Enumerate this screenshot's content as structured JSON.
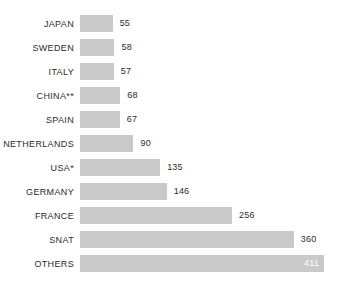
{
  "chart_data": {
    "type": "bar",
    "orientation": "horizontal",
    "title": "",
    "subtitle": "",
    "xlabel": "",
    "ylabel": "",
    "grid": false,
    "legend": false,
    "axis_visible": false,
    "xlim": [
      0,
      411
    ],
    "categories": [
      "JAPAN",
      "SWEDEN",
      "ITALY",
      "CHINA**",
      "SPAIN",
      "NETHERLANDS",
      "USA*",
      "GERMANY",
      "FRANCE",
      "SNAT",
      "OTHERS"
    ],
    "values": [
      55,
      58,
      57,
      68,
      67,
      90,
      135,
      146,
      256,
      360,
      411
    ],
    "value_labels": [
      "55",
      "58",
      "57",
      "68",
      "67",
      "90",
      "135",
      "146",
      "256",
      "360",
      "411"
    ],
    "label_placement": [
      "outside",
      "outside",
      "outside",
      "outside",
      "outside",
      "outside",
      "outside",
      "outside",
      "outside",
      "outside",
      "inside"
    ],
    "bar_color": "#c9c9c9",
    "label_color": "#2b2b2b",
    "inside_label_color": "#ffffff",
    "background_color": "#ffffff",
    "bars": [
      {
        "category": "JAPAN",
        "value": 55,
        "label": "55",
        "placement": "outside"
      },
      {
        "category": "SWEDEN",
        "value": 58,
        "label": "58",
        "placement": "outside"
      },
      {
        "category": "ITALY",
        "value": 57,
        "label": "57",
        "placement": "outside"
      },
      {
        "category": "CHINA**",
        "value": 68,
        "label": "68",
        "placement": "outside"
      },
      {
        "category": "SPAIN",
        "value": 67,
        "label": "67",
        "placement": "outside"
      },
      {
        "category": "NETHERLANDS",
        "value": 90,
        "label": "90",
        "placement": "outside"
      },
      {
        "category": "USA*",
        "value": 135,
        "label": "135",
        "placement": "outside"
      },
      {
        "category": "GERMANY",
        "value": 146,
        "label": "146",
        "placement": "outside"
      },
      {
        "category": "FRANCE",
        "value": 256,
        "label": "256",
        "placement": "outside"
      },
      {
        "category": "SNAT",
        "value": 360,
        "label": "360",
        "placement": "outside"
      },
      {
        "category": "OTHERS",
        "value": 411,
        "label": "411",
        "placement": "inside"
      }
    ]
  }
}
